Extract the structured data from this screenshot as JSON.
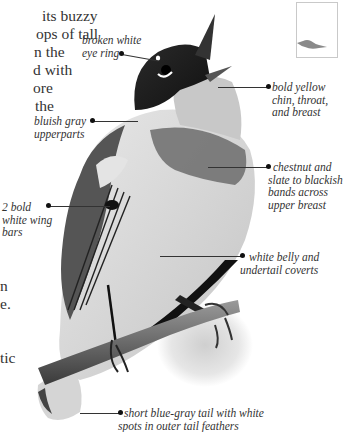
{
  "body_text": {
    "lines": [
      "its buzzy",
      "ops of tall",
      "n the",
      "d with",
      "ore",
      "the",
      "",
      "",
      "",
      "",
      "",
      "",
      "",
      "",
      "n",
      "e.",
      "",
      "",
      "tic"
    ]
  },
  "range_map": {
    "icon": "bird-silhouette-icon"
  },
  "labels": {
    "eye_ring": [
      "broken white",
      "eye ring"
    ],
    "upperparts": [
      "bluish gray",
      "upperparts"
    ],
    "chin": [
      "bold yellow",
      "chin, throat,",
      "and breast"
    ],
    "breast_bands": [
      "chestnut and",
      "slate to blackish",
      "bands across",
      "upper breast"
    ],
    "wing_bars": [
      "2 bold",
      "white wing",
      "bars"
    ],
    "belly": [
      "white belly and",
      "undertail coverts"
    ],
    "tail": [
      "short blue-gray tail with white",
      "spots in outer tail feathers"
    ]
  },
  "colors": {
    "text": "#333333",
    "leader": "#333333",
    "bird_dark": "#1a1a1a",
    "bird_mid": "#7a7a7a",
    "bird_light": "#d9d9d9"
  }
}
